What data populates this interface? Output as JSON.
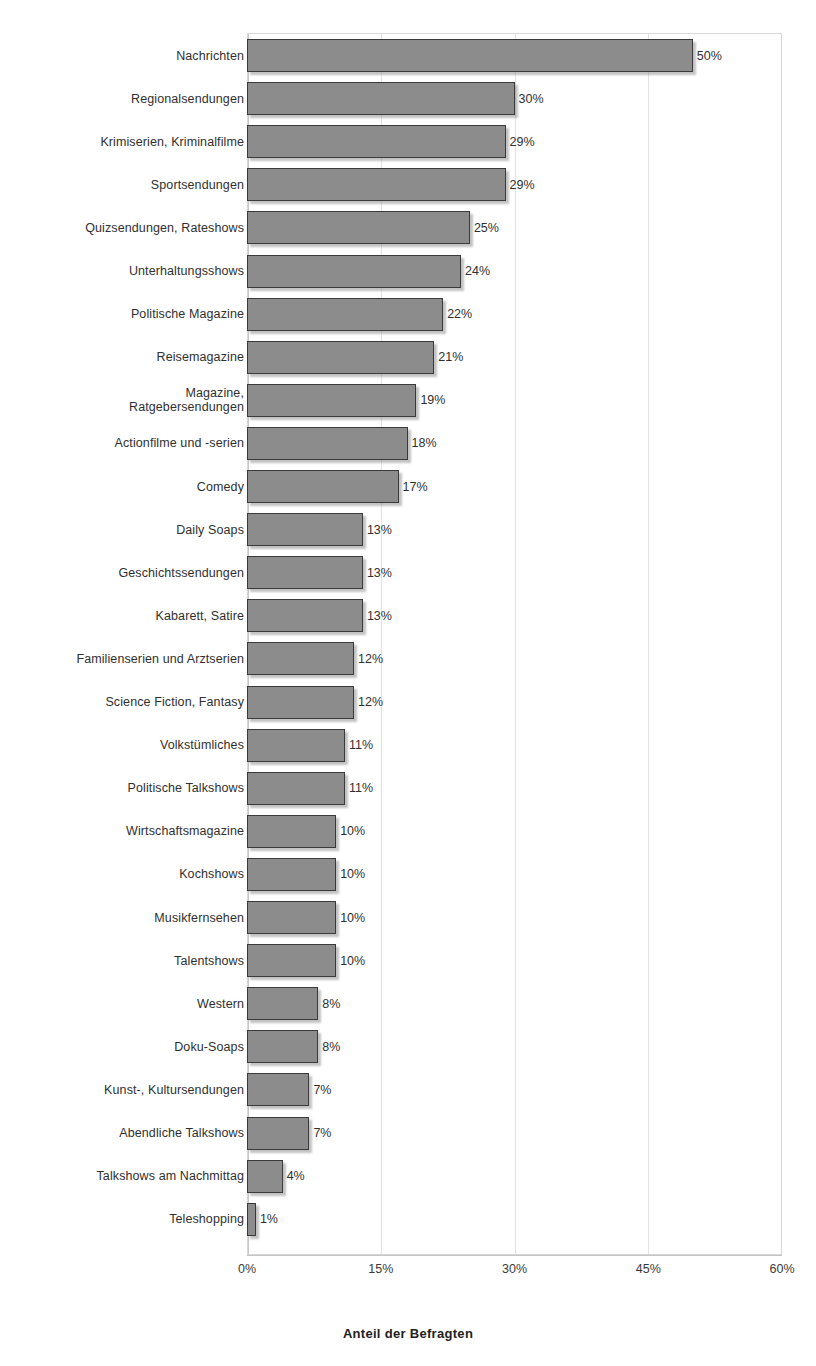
{
  "chart_data": {
    "type": "bar",
    "orientation": "horizontal",
    "title": "",
    "subtitle": "",
    "xlabel": "Anteil der Befragten",
    "ylabel": "",
    "xlim": [
      0,
      60
    ],
    "xtick_labels": [
      "0%",
      "15%",
      "30%",
      "45%",
      "60%"
    ],
    "xticks": [
      0,
      15,
      30,
      45,
      60
    ],
    "grid": true,
    "legend": null,
    "value_suffix": "%",
    "categories": [
      "Nachrichten",
      "Regionalsendungen",
      "Krimiserien, Kriminalfilme",
      "Sportsendungen",
      "Quizsendungen, Rateshows",
      "Unterhaltungsshows",
      "Politische Magazine",
      "Reisemagazine",
      "Magazine,\nRatgebersendungen",
      "Actionfilme und -serien",
      "Comedy",
      "Daily Soaps",
      "Geschichtssendungen",
      "Kabarett, Satire",
      "Familienserien und Arztserien",
      "Science Fiction, Fantasy",
      "Volkstümliches",
      "Politische Talkshows",
      "Wirtschaftsmagazine",
      "Kochshows",
      "Musikfernsehen",
      "Talentshows",
      "Western",
      "Doku-Soaps",
      "Kunst-, Kultursendungen",
      "Abendliche Talkshows",
      "Talkshows am Nachmittag",
      "Teleshopping"
    ],
    "values": [
      50,
      30,
      29,
      29,
      25,
      24,
      22,
      21,
      19,
      18,
      17,
      13,
      13,
      13,
      12,
      12,
      11,
      11,
      10,
      10,
      10,
      10,
      8,
      8,
      7,
      7,
      4,
      1
    ],
    "data_labels": [
      "50%",
      "30%",
      "29%",
      "29%",
      "25%",
      "24%",
      "22%",
      "21%",
      "19%",
      "18%",
      "17%",
      "13%",
      "13%",
      "13%",
      "12%",
      "12%",
      "11%",
      "11%",
      "10%",
      "10%",
      "10%",
      "10%",
      "8%",
      "8%",
      "7%",
      "7%",
      "4%",
      "1%"
    ],
    "colors": {
      "bar_fill": "#8c8c8c",
      "bar_border": "#3a3a3a",
      "gridline": "#e2e2e2",
      "axis": "#c4c4c4",
      "text": "#2f2f2f",
      "background": "#ffffff"
    }
  }
}
